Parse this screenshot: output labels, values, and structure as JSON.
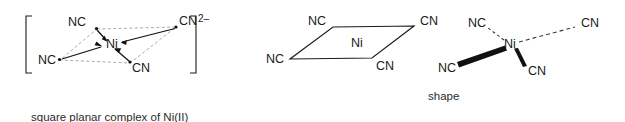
{
  "figure": {
    "background_color": "#ffffff",
    "line_color": "#1a1a1a",
    "dashed_color": "#9a9a9a"
  },
  "structures": {
    "left": {
      "name": "bracketed-square-planar-complex",
      "center_atom": "Ni",
      "charge": "2–",
      "bracket_left": "[",
      "bracket_right": "]",
      "ligands": [
        {
          "label": "NC",
          "position": "top-left"
        },
        {
          "label": "CN",
          "position": "top-right"
        },
        {
          "label": "NC",
          "position": "bottom-left"
        },
        {
          "label": "CN",
          "position": "bottom-right"
        }
      ],
      "bond_style": "dative-arrows-to-metal",
      "outline_style": "dashed-parallelogram"
    },
    "middle": {
      "name": "parallelogram-shape",
      "center_atom": "Ni",
      "ligands": [
        {
          "label": "NC",
          "position": "top-left"
        },
        {
          "label": "CN",
          "position": "top-right"
        },
        {
          "label": "NC",
          "position": "bottom-left"
        },
        {
          "label": "CN",
          "position": "bottom-right"
        }
      ],
      "bond_style": "plain-solid-lines",
      "outline_style": "solid-parallelogram"
    },
    "right": {
      "name": "wedge-dash-stereo-structure",
      "center_atom": "Ni",
      "ligands": [
        {
          "label": "NC",
          "position": "upper-left",
          "bond": "dashed"
        },
        {
          "label": "CN",
          "position": "right",
          "bond": "dashed"
        },
        {
          "label": "NC",
          "position": "lower-left",
          "bond": "bold-wedge"
        },
        {
          "label": "CN",
          "position": "lower-right",
          "bond": "solid-wedge"
        }
      ]
    }
  },
  "captions": {
    "left_line1": "square planar complex of Ni(II)",
    "left_line2": "coordination number 4",
    "right": "shape"
  }
}
